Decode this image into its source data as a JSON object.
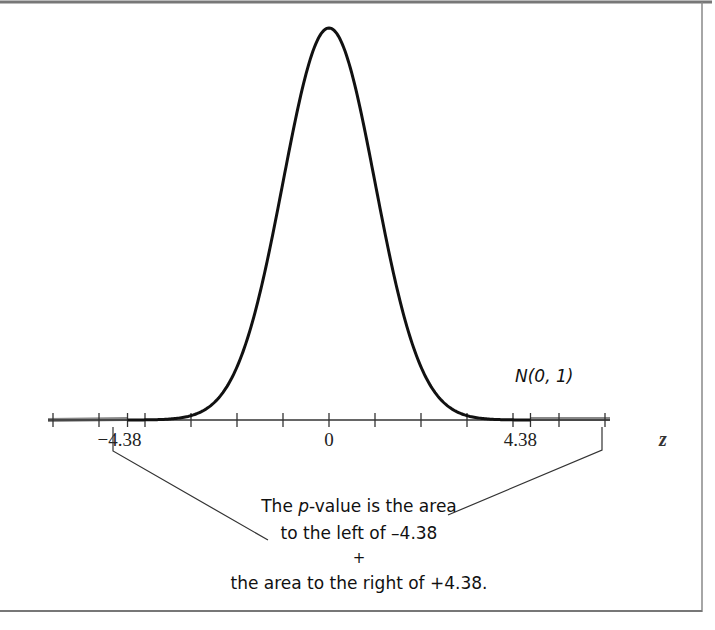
{
  "chart_data": {
    "type": "line",
    "title": "",
    "curve_label": "N(0, 1)",
    "distribution": {
      "name": "normal",
      "mean": 0,
      "sd": 1
    },
    "xlabel": "z",
    "xlim": [
      -6,
      6
    ],
    "x_ticks": [
      -6,
      -5,
      -4,
      -3,
      -2,
      -1,
      0,
      1,
      2,
      3,
      4,
      5,
      6
    ],
    "tick_labels": [
      {
        "value": -4.38,
        "label": "−4.38"
      },
      {
        "value": 0,
        "label": "0"
      },
      {
        "value": 4.38,
        "label": "4.38"
      }
    ],
    "shaded_tails": {
      "left_below": -4.38,
      "right_above": 4.38
    },
    "annotation": {
      "line1_pre": "The ",
      "line1_italic": "p",
      "line1_post": "-value is the area",
      "line2": "to the left of –4.38",
      "line3": "+",
      "line4": "the area to the right of +4.38."
    }
  }
}
